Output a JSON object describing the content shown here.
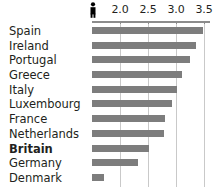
{
  "chart_data": {
    "type": "bar",
    "orientation": "horizontal",
    "title": "",
    "subtitle": "",
    "xlabel": "",
    "ylabel": "",
    "categories": [
      "Spain",
      "Ireland",
      "Portugal",
      "Greece",
      "Italy",
      "Luxembourg",
      "France",
      "Netherlands",
      "Britain",
      "Germany",
      "Denmark"
    ],
    "values": [
      3.48,
      3.35,
      3.25,
      3.1,
      3.02,
      2.92,
      2.8,
      2.78,
      2.52,
      2.33,
      1.72
    ],
    "highlighted_category": "Britain",
    "xlim": [
      1.5,
      3.6
    ],
    "bar_base": 1.5,
    "tick_values": [
      2.0,
      2.5,
      3.0,
      3.5
    ],
    "tick_labels": [
      "2.0",
      "2.5",
      "3.0",
      "3.5"
    ],
    "grid": "vertical",
    "legend": "none",
    "axis_icon": "person-icon",
    "colors": {
      "bar": "#7d7d7d",
      "gridline": "#c9c9c9",
      "axis": "#8c8c8c",
      "text": "#231f20",
      "background": "#ffffff"
    }
  }
}
